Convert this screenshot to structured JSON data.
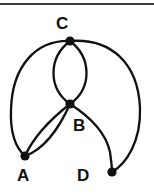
{
  "figure": {
    "kind": "undirected-multigraph-drawing",
    "width": 154,
    "height": 194,
    "background_color": "#ffffff",
    "stroke_color": "#111111",
    "top_rule": {
      "name": "horizontal-rule",
      "y": 4,
      "x_start": 0,
      "x_end": 154,
      "thickness": 2,
      "color": "#3a3a3a"
    },
    "nodes": [
      {
        "id": "C",
        "label": "C",
        "x": 70,
        "y": 41,
        "radius": 4.5,
        "label_x": 56,
        "label_y": 15
      },
      {
        "id": "B",
        "label": "B",
        "x": 70,
        "y": 104,
        "radius": 4.5,
        "label_x": 73,
        "label_y": 117
      },
      {
        "id": "A",
        "label": "A",
        "x": 25,
        "y": 156,
        "radius": 4.5,
        "label_x": 17,
        "label_y": 167
      },
      {
        "id": "D",
        "label": "D",
        "x": 112,
        "y": 172,
        "radius": 4.5,
        "label_x": 77,
        "label_y": 167
      }
    ],
    "edges": [
      {
        "id": "C-B-left",
        "from": "C",
        "to": "B",
        "style": "curve-left",
        "path": "M70,41 C48,58 48,88 70,104"
      },
      {
        "id": "C-B-right",
        "from": "C",
        "to": "B",
        "style": "curve-right",
        "path": "M70,41 C92,58 92,88 70,104"
      },
      {
        "id": "C-A",
        "from": "C",
        "to": "A",
        "style": "long-left-arc",
        "path": "M70,41 C36,40 12,66 11,110 C10,135 16,148 25,156"
      },
      {
        "id": "C-D",
        "from": "C",
        "to": "D",
        "style": "long-right-arc",
        "path": "M70,41 C110,38 138,62 140,108 C141,142 126,164 112,172"
      },
      {
        "id": "B-A-upper",
        "from": "B",
        "to": "A",
        "style": "curve-upper",
        "path": "M70,104 C52,118 34,136 25,156"
      },
      {
        "id": "B-A-lower",
        "from": "B",
        "to": "A",
        "style": "curve-lower",
        "path": "M70,104 C58,131 42,150 25,156"
      },
      {
        "id": "B-D",
        "from": "B",
        "to": "D",
        "style": "s-curve",
        "path": "M70,104 C92,118 106,134 110,152 C111,160 112,166 112,172"
      }
    ]
  },
  "labels": {
    "A": "A",
    "B": "B",
    "C": "C",
    "D": "D"
  }
}
